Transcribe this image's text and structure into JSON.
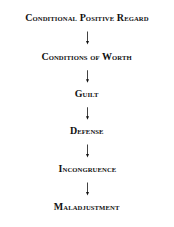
{
  "diagram": {
    "type": "vertical-flowchart",
    "direction": "top-to-bottom",
    "nodes": [
      {
        "id": "n1",
        "label": "Conditional Positive Regard"
      },
      {
        "id": "n2",
        "label": "Conditions of Worth"
      },
      {
        "id": "n3",
        "label": "Guilt"
      },
      {
        "id": "n4",
        "label": "Defense"
      },
      {
        "id": "n5",
        "label": "Incongruence"
      },
      {
        "id": "n6",
        "label": "Maladjustment"
      }
    ],
    "edges": [
      {
        "from": "n1",
        "to": "n2"
      },
      {
        "from": "n2",
        "to": "n3"
      },
      {
        "from": "n3",
        "to": "n4"
      },
      {
        "from": "n4",
        "to": "n5"
      },
      {
        "from": "n5",
        "to": "n6"
      }
    ],
    "colors": {
      "text": "#111111",
      "arrow": "#111111",
      "background": "#ffffff"
    }
  }
}
